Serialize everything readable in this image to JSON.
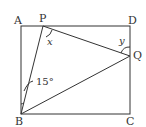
{
  "diagram": {
    "type": "geometry",
    "shape": "rectangle ABCD with points P on AD and Q on DC",
    "points": {
      "A": {
        "label": "A",
        "x": 21,
        "y": 26
      },
      "D": {
        "label": "D",
        "x": 130,
        "y": 26
      },
      "B": {
        "label": "B",
        "x": 21,
        "y": 114
      },
      "C": {
        "label": "C",
        "x": 130,
        "y": 114
      },
      "P": {
        "label": "P",
        "x": 43,
        "y": 26
      },
      "Q": {
        "label": "Q",
        "x": 130,
        "y": 56
      }
    },
    "segments": [
      "AD",
      "DC",
      "CB",
      "BA",
      "BP",
      "PQ",
      "BQ"
    ],
    "angles": {
      "ABP": {
        "label": "15°"
      },
      "x": {
        "label": "x",
        "vertex": "P"
      },
      "y": {
        "label": "y",
        "vertex": "Q"
      }
    },
    "line_color": "#333333"
  }
}
